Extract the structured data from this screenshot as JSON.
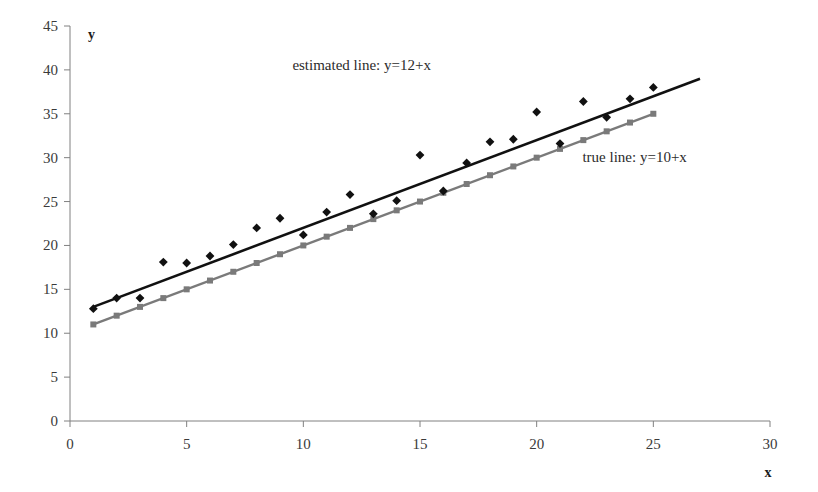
{
  "chart_data": {
    "type": "scatter",
    "title": "",
    "subtitle": "",
    "xlabel": "x",
    "ylabel": "y",
    "xlim": [
      0,
      30
    ],
    "ylim": [
      0,
      45
    ],
    "xticks": [
      0,
      5,
      10,
      15,
      20,
      25,
      30
    ],
    "yticks": [
      0,
      5,
      10,
      15,
      20,
      25,
      30,
      35,
      40,
      45
    ],
    "grid": false,
    "legend_position": "inline-annotations",
    "annotations": [
      {
        "text": "estimated line: y=12+x",
        "x": 12.5,
        "y": 40.0
      },
      {
        "text": "true line: y=10+x",
        "x": 24.2,
        "y": 29.5
      }
    ],
    "colors": {
      "scatter": "#111111",
      "estimated_line": "#111111",
      "true_line": "#7a7a7a",
      "axis": "#808080",
      "text": "#2b2b2b"
    },
    "series": [
      {
        "name": "observed data",
        "type": "scatter",
        "marker": "diamond",
        "color": "#111111",
        "x": [
          1,
          2,
          3,
          4,
          5,
          6,
          7,
          8,
          9,
          10,
          11,
          12,
          13,
          14,
          15,
          16,
          17,
          18,
          19,
          20,
          21,
          22,
          23,
          24,
          25
        ],
        "y": [
          12.8,
          14.0,
          14.0,
          18.1,
          18.0,
          18.8,
          20.1,
          22.0,
          23.1,
          21.2,
          23.8,
          25.8,
          23.6,
          25.1,
          30.3,
          26.2,
          29.4,
          31.8,
          32.1,
          35.2,
          31.6,
          36.4,
          34.6,
          36.7,
          38.0
        ]
      },
      {
        "name": "estimated line: y=12+x",
        "type": "line",
        "color": "#111111",
        "intercept": 12,
        "slope": 1,
        "x_range": [
          1,
          27
        ]
      },
      {
        "name": "true line: y=10+x",
        "type": "line",
        "marker": "square",
        "color": "#7a7a7a",
        "intercept": 10,
        "slope": 1,
        "x_range": [
          1,
          25
        ],
        "x": [
          1,
          2,
          3,
          4,
          5,
          6,
          7,
          8,
          9,
          10,
          11,
          12,
          13,
          14,
          15,
          16,
          17,
          18,
          19,
          20,
          21,
          22,
          23,
          24,
          25
        ],
        "y": [
          11,
          12,
          13,
          14,
          15,
          16,
          17,
          18,
          19,
          20,
          21,
          22,
          23,
          24,
          25,
          26,
          27,
          28,
          29,
          30,
          31,
          32,
          33,
          34,
          35
        ]
      }
    ]
  }
}
